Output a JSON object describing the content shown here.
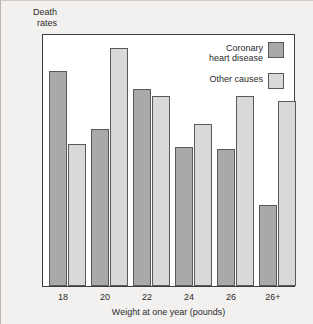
{
  "chart_data": {
    "type": "bar",
    "title": "",
    "xlabel": "Weight at one year (pounds)",
    "ylabel": "Death\nrates",
    "categories": [
      "18",
      "20",
      "22",
      "24",
      "26",
      "26+"
    ],
    "series": [
      {
        "name": "Coronary\nheart disease",
        "color": "#a9a9a9",
        "values": [
          85,
          62,
          78,
          55,
          54,
          32
        ]
      },
      {
        "name": "Other causes",
        "color": "#d9d9d9",
        "values": [
          56,
          94,
          75,
          64,
          75,
          73
        ]
      }
    ],
    "ylim": [
      0,
      100
    ],
    "grid": false,
    "legend_position": "top-right",
    "axis_ticks_visible": false
  },
  "legend": {
    "entries": [
      {
        "label": "Coronary\nheart disease",
        "swatch": "dark-gray"
      },
      {
        "label": "Other causes",
        "swatch": "light-gray"
      }
    ]
  },
  "colors": {
    "series_dark": "#a9a9a9",
    "series_light": "#d9d9d9",
    "bar_outline": "#5a5a5a",
    "frame": "#3d3d3d",
    "page_background": "#f3f1ef",
    "plot_background": "#ffffff",
    "text": "#2b2b2b"
  }
}
